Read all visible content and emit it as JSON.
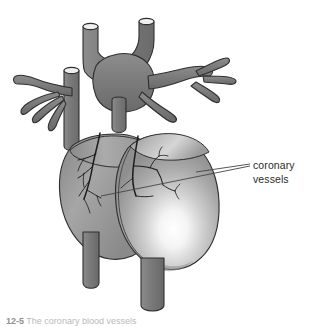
{
  "figure": {
    "domain": "anatomical-diagram",
    "background_color": "#ffffff",
    "view": "anterior"
  },
  "labels": [
    {
      "id": "coronary-vessels",
      "line1": "coronary",
      "line2": "vessels",
      "x": 253,
      "y": 158,
      "color": "#2b2b2b",
      "font_size_px": 10.5
    }
  ],
  "caption": {
    "number": "12-5",
    "text": "The coronary blood vessels",
    "clipped": true,
    "color": "#b9b9b9"
  },
  "colors": {
    "vessel_gray": "#7d7d7d",
    "vessel_gray_dark": "#6a6a6a",
    "vessel_gray_light": "#9a9a9a",
    "outline": "#2f2f2f",
    "heart_mid": "#a8a8a8",
    "heart_light": "#d8d8d8",
    "heart_highlight": "#ffffff",
    "heart_shadow": "#858585",
    "coronary_line": "#1c1c1c",
    "leader_line": "#444444",
    "cut_end": "#f2f2f2"
  },
  "parts": [
    {
      "id": "aorta-arch",
      "name": "aorta",
      "kind": "great-vessel"
    },
    {
      "id": "pulmonary-trunk",
      "name": "pulmonary trunk",
      "kind": "great-vessel"
    },
    {
      "id": "superior-vena-cava",
      "name": "superior vena cava",
      "kind": "great-vessel"
    },
    {
      "id": "pulmonary-veins-left",
      "name": "left pulmonary veins",
      "kind": "branching-vessel"
    },
    {
      "id": "pulmonary-veins-right",
      "name": "right pulmonary veins",
      "kind": "branching-vessel"
    },
    {
      "id": "right-ventricle",
      "name": "right ventricle",
      "kind": "chamber"
    },
    {
      "id": "left-ventricle",
      "name": "left ventricle",
      "kind": "chamber"
    },
    {
      "id": "inferior-vena-cava-stump",
      "name": "inferior vena cava stump",
      "kind": "great-vessel"
    },
    {
      "id": "descending-aorta-stump",
      "name": "descending aorta stump",
      "kind": "great-vessel"
    },
    {
      "id": "coronary-vessel-network",
      "name": "coronary vessels",
      "kind": "surface-vessels"
    }
  ],
  "leader_lines": [
    {
      "id": "leader-upper",
      "from_x": 196,
      "from_y": 172,
      "to_x": 250,
      "to_y": 164
    },
    {
      "id": "leader-lower",
      "from_x": 101,
      "from_y": 196,
      "to_x": 250,
      "to_y": 166
    }
  ]
}
